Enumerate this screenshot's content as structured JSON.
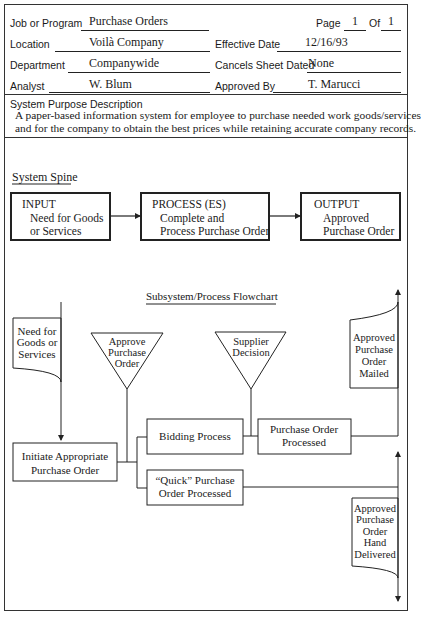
{
  "header": {
    "job_label": "Job or Program",
    "job_value": "Purchase Orders",
    "page_label": "Page",
    "page_value": "1",
    "of_label": "Of",
    "of_value": "1",
    "location_label": "Location",
    "location_value": "Voilà Company",
    "effective_label": "Effective Date",
    "effective_value": "12/16/93",
    "department_label": "Department",
    "department_value": "Companywide",
    "cancels_label": "Cancels Sheet Dated",
    "cancels_value": "None",
    "analyst_label": "Analyst",
    "analyst_value": "W. Blum",
    "approved_label": "Approved By",
    "approved_value": "T. Marucci"
  },
  "description": {
    "title": "System Purpose Description",
    "line1": "A paper-based information system for employee to purchase needed work goods/services",
    "line2": "and for the company to obtain the best prices while retaining accurate company records."
  },
  "spine": {
    "title": "System Spine",
    "boxes": [
      {
        "heading": "INPUT",
        "line1": "Need for Goods",
        "line2": "or Services"
      },
      {
        "heading": "PROCESS (ES)",
        "line1": "Complete and",
        "line2": "Process Purchase Order"
      },
      {
        "heading": "OUTPUT",
        "line1": "Approved",
        "line2": "Purchase Order"
      }
    ]
  },
  "flowchart": {
    "title": "Subsystem/Process Flowchart",
    "input_doc": [
      "Need for",
      "Goods or",
      "Services"
    ],
    "approve_tri": [
      "Approve",
      "Purchase",
      "Order"
    ],
    "supplier_tri": [
      "Supplier",
      "Decision"
    ],
    "mailed_doc": [
      "Approved",
      "Purchase",
      "Order",
      "Mailed"
    ],
    "initiate": [
      "Initiate Appropriate",
      "Purchase Order"
    ],
    "bidding": "Bidding Process",
    "po_processed": [
      "Purchase Order",
      "Processed"
    ],
    "quick": [
      "“Quick” Purchase",
      "Order Processed"
    ],
    "hand_doc": [
      "Approved",
      "Purchase",
      "Order",
      "Hand",
      "Delivered"
    ]
  }
}
